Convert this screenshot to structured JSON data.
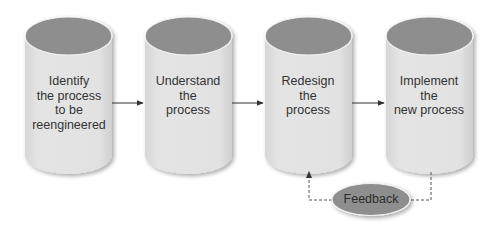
{
  "diagram": {
    "type": "process-flow",
    "steps": [
      {
        "label": "Identify\nthe process\nto be\nreengineered"
      },
      {
        "label": "Understand\nthe\nprocess"
      },
      {
        "label": "Redesign\nthe\nprocess"
      },
      {
        "label": "Implement\nthe\nnew process"
      }
    ],
    "feedback": {
      "label": "Feedback"
    },
    "colors": {
      "cylinder_top": "#8e8e8e",
      "cylinder_body": "#e2e2e2",
      "feedback_fill": "#8e8e8e",
      "text": "#333333",
      "arrow": "#333333",
      "dashed_line": "#555555"
    }
  }
}
